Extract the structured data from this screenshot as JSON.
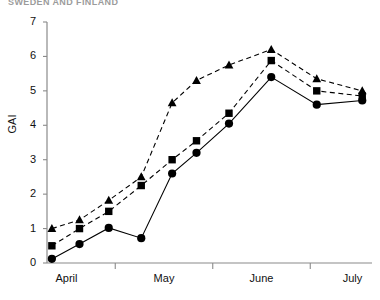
{
  "figure": {
    "clipped_header": "SWEDEN AND FINLAND",
    "ylabel": "GAI",
    "y_ticks": [
      "0",
      "1",
      "2",
      "3",
      "4",
      "5",
      "6",
      "7"
    ],
    "x_ticks": [
      "April",
      "May",
      "June",
      "July"
    ]
  },
  "chart_data": {
    "type": "line",
    "title": "",
    "xlabel": "",
    "ylabel": "GAI",
    "ylim": [
      0,
      7
    ],
    "xlim": [
      0,
      10
    ],
    "grid": false,
    "legend": "none",
    "x_tick_labels": [
      "April",
      "May",
      "June",
      "July"
    ],
    "x_tick_positions": [
      0.6,
      3.6,
      6.6,
      9.4
    ],
    "y_tick_values": [
      0,
      1,
      2,
      3,
      4,
      5,
      6,
      7
    ],
    "series": [
      {
        "name": "series-circle",
        "marker": "circle",
        "linestyle": "solid",
        "color": "#000000",
        "x": [
          0.15,
          1.0,
          1.9,
          2.9,
          3.85,
          4.6,
          5.6,
          6.9,
          8.3,
          9.7
        ],
        "y": [
          0.12,
          0.55,
          1.02,
          0.72,
          2.6,
          3.2,
          4.05,
          5.4,
          4.6,
          4.72
        ]
      },
      {
        "name": "series-square",
        "marker": "square",
        "linestyle": "dashed",
        "color": "#000000",
        "x": [
          0.15,
          1.0,
          1.9,
          2.9,
          3.85,
          4.6,
          5.6,
          6.9,
          8.3,
          9.7
        ],
        "y": [
          0.5,
          1.0,
          1.5,
          2.25,
          3.0,
          3.55,
          4.35,
          5.88,
          5.0,
          4.85
        ]
      },
      {
        "name": "series-triangle",
        "marker": "triangle",
        "linestyle": "dashed",
        "color": "#000000",
        "x": [
          0.15,
          1.0,
          1.9,
          2.9,
          3.85,
          4.6,
          5.6,
          6.9,
          8.3,
          9.7
        ],
        "y": [
          1.0,
          1.25,
          1.82,
          2.5,
          4.65,
          5.3,
          5.75,
          6.2,
          5.35,
          5.0
        ]
      }
    ]
  }
}
